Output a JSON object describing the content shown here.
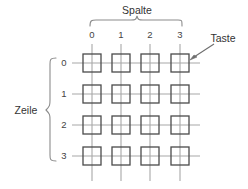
{
  "diagram": {
    "title_column": "Spalte",
    "title_row": "Zeile",
    "callout": "Taste",
    "column_indices": [
      "0",
      "1",
      "2",
      "3"
    ],
    "row_indices": [
      "0",
      "1",
      "2",
      "3"
    ],
    "colors": {
      "key_outline": "#4a4a4a",
      "matrix_line": "#a8a8a8",
      "brace": "#8c8c8c",
      "text": "#3a3a3a",
      "arrow": "#6e6e6e",
      "background": "#ffffff"
    },
    "geometry": {
      "column_x": [
        92,
        121,
        150,
        180
      ],
      "row_y": [
        63,
        94,
        125,
        156
      ],
      "key_size": 18,
      "grid_type": "4x4-key-matrix"
    }
  }
}
